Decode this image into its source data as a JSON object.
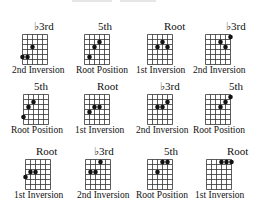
{
  "header": {
    "partial_title": ""
  },
  "grid": {
    "strings": 6,
    "frets": 6,
    "line_color": "#333333",
    "dot_color": "#111111"
  },
  "chords": [
    {
      "interval": "♭3rd",
      "caption": "2nd Inversion",
      "dots": [
        [
          2,
          2
        ],
        [
          0,
          4
        ],
        [
          1,
          4
        ]
      ]
    },
    {
      "interval": "5th",
      "caption": "Root Position",
      "dots": [
        [
          3,
          1
        ],
        [
          2,
          2
        ],
        [
          1,
          4
        ]
      ]
    },
    {
      "interval": "Root",
      "caption": "1st Inversion",
      "dots": [
        [
          3,
          1
        ],
        [
          2,
          2
        ],
        [
          4,
          2
        ]
      ]
    },
    {
      "interval": "♭3rd",
      "caption": "2nd Inversion",
      "dots": [
        [
          5,
          0
        ],
        [
          3,
          1
        ],
        [
          4,
          2
        ]
      ]
    },
    {
      "interval": "5th",
      "caption": "Root Position",
      "dots": [
        [
          2,
          1
        ],
        [
          1,
          2
        ],
        [
          0,
          4
        ]
      ]
    },
    {
      "interval": "Root",
      "caption": "1st Inversion",
      "dots": [
        [
          2,
          2
        ],
        [
          3,
          2
        ],
        [
          1,
          3
        ]
      ]
    },
    {
      "interval": "♭3rd",
      "caption": "2nd Inversion",
      "dots": [
        [
          4,
          1
        ],
        [
          2,
          2
        ],
        [
          3,
          2
        ]
      ]
    },
    {
      "interval": "5th",
      "caption": "Root Position",
      "dots": [
        [
          5,
          0
        ],
        [
          4,
          1
        ],
        [
          3,
          2
        ]
      ]
    },
    {
      "interval": "Root",
      "caption": "1st Inversion",
      "dots": [
        [
          1,
          2
        ],
        [
          2,
          2
        ],
        [
          0,
          3
        ]
      ]
    },
    {
      "interval": "♭3rd",
      "caption": "2nd Inversion",
      "dots": [
        [
          3,
          0
        ],
        [
          1,
          2
        ],
        [
          2,
          2
        ]
      ]
    },
    {
      "interval": "5th",
      "caption": "Root Position",
      "dots": [
        [
          3,
          0
        ],
        [
          4,
          0
        ],
        [
          2,
          2
        ]
      ]
    },
    {
      "interval": "Root",
      "caption": "1st Inversion",
      "dots": [
        [
          3,
          0
        ],
        [
          4,
          0
        ],
        [
          5,
          0
        ]
      ]
    }
  ]
}
